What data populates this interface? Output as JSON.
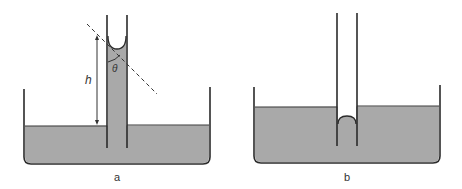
{
  "figure": {
    "colors": {
      "liquid": "#a9a9a9",
      "stroke": "#2b2b2b",
      "background": "#ffffff"
    },
    "panels": [
      {
        "id": "a",
        "caption": "a",
        "description": "Capillary rise: liquid wets tube, concave meniscus, liquid column raised above bath level",
        "height_label": "h",
        "angle_label": "θ"
      },
      {
        "id": "b",
        "caption": "b",
        "description": "Capillary depression: non-wetting liquid, convex meniscus below bath level"
      }
    ]
  }
}
